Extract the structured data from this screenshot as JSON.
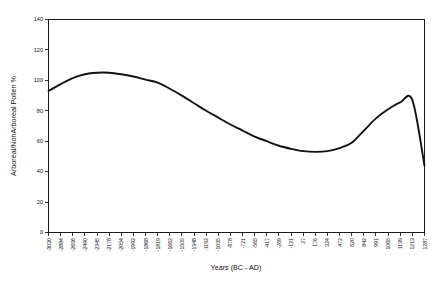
{
  "chart_data": {
    "type": "line",
    "title": "",
    "subtitle": "",
    "xlabel": "Years (BC - AD)",
    "ylabel": "Arboreal/NonArboreal Pollen %",
    "xlim": [
      0,
      36
    ],
    "ylim": [
      0,
      140
    ],
    "grid": false,
    "legend": false,
    "legend_position": "none",
    "y_ticks": [
      0,
      20,
      40,
      60,
      80,
      100,
      120,
      140
    ],
    "categories": [
      "-3030",
      "-2884",
      "-2656",
      "-2490",
      "-2345",
      "-2178",
      "-2054",
      "-1992",
      "-1868",
      "-1819",
      "-1662",
      "-1505",
      "-1348",
      "-1192",
      "-1035",
      "-878",
      "-721",
      "-565",
      "-417",
      "-269",
      "-121",
      "27",
      "176",
      "324",
      "472",
      "620",
      "842",
      "991",
      "1065",
      "1139",
      "1213",
      "1287"
    ],
    "series": [
      {
        "name": "Arboreal/NonArboreal Pollen %",
        "color": "#111111",
        "values": [
          93,
          97.5,
          101.5,
          104,
          105,
          105,
          104,
          102.5,
          100.5,
          98.5,
          94.5,
          90,
          85,
          80,
          75.5,
          71,
          67,
          63,
          60,
          57,
          55,
          53.5,
          53,
          53.5,
          55.5,
          59,
          67,
          75,
          81,
          85.5,
          87,
          44
        ]
      }
    ],
    "annotations": {
      "first_peak_value": 105,
      "trough_value": 53,
      "second_peak_value": 87,
      "start_value": 93,
      "end_value": 44
    }
  },
  "axes": {
    "y_axis_title": "Arboreal/NonArboreal Pollen %",
    "x_axis_title": "Years (BC - AD)"
  }
}
